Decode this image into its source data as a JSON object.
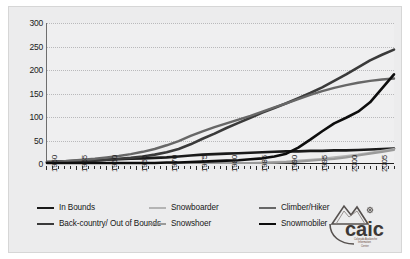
{
  "figure": {
    "background": "#ececed",
    "plot_background": "#efeff0"
  },
  "logo": {
    "name": "caic-logo",
    "wordmark": "caic",
    "line1": "Colorado Avalanche",
    "line2": "Information",
    "line3": "Center"
  },
  "legend": {
    "items": [
      {
        "label": "In Bounds",
        "color": "#1a1a1a",
        "width": 2.6
      },
      {
        "label": "Back-country/ Out of Bounds",
        "color": "#3a3a3a",
        "width": 2.6
      },
      {
        "label": "Snowboarder",
        "color": "#b4b4b4",
        "width": 2.2
      },
      {
        "label": "Snowshoer",
        "color": "#9a9a9a",
        "width": 2.2
      },
      {
        "label": "Climber/Hiker",
        "color": "#676767",
        "width": 2.4
      },
      {
        "label": "Snowmobiler",
        "color": "#0d0d0d",
        "width": 2.6
      }
    ]
  },
  "chart_data": {
    "type": "line",
    "title": "",
    "subtitle": "",
    "xlabel": "",
    "ylabel": "",
    "xlim": [
      1950,
      2008
    ],
    "ylim": [
      0,
      300
    ],
    "yticks": [
      0,
      50,
      100,
      150,
      200,
      250,
      300
    ],
    "xticks": [
      1950,
      1955,
      1960,
      1965,
      1970,
      1975,
      1980,
      1985,
      1990,
      1995,
      2000,
      2005
    ],
    "xtick_labels": [
      "1950",
      "1955",
      "1960",
      "1965",
      "1970",
      "1975",
      "1980",
      "1985",
      "1990",
      "1995",
      "2000",
      "2005"
    ],
    "ytick_labels": [
      "0",
      "50",
      "100",
      "150",
      "200",
      "250",
      "300"
    ],
    "grid": true,
    "legend_position": "bottom",
    "x": [
      1950,
      1952,
      1954,
      1956,
      1958,
      1960,
      1962,
      1964,
      1966,
      1968,
      1970,
      1972,
      1974,
      1976,
      1978,
      1980,
      1982,
      1984,
      1986,
      1988,
      1990,
      1992,
      1994,
      1996,
      1998,
      2000,
      2002,
      2004,
      2006,
      2008
    ],
    "series": [
      {
        "name": "In Bounds",
        "color": "#1a1a1a",
        "width": 2.6,
        "values": [
          2,
          3,
          4,
          5,
          6,
          7,
          8,
          9,
          10,
          11,
          12,
          14,
          16,
          18,
          19,
          20,
          21,
          22,
          23,
          24,
          25,
          25,
          26,
          26,
          27,
          27,
          28,
          29,
          30,
          31
        ]
      },
      {
        "name": "Back-country/ Out of Bounds",
        "color": "#3a3a3a",
        "width": 2.6,
        "values": [
          1,
          2,
          3,
          4,
          5,
          7,
          9,
          11,
          14,
          18,
          23,
          30,
          40,
          52,
          63,
          75,
          86,
          97,
          108,
          118,
          128,
          139,
          150,
          162,
          176,
          190,
          205,
          220,
          232,
          243
        ]
      },
      {
        "name": "Snowboarder",
        "color": "#b4b4b4",
        "width": 2.2,
        "values": [
          0,
          0,
          0,
          0,
          0,
          0,
          0,
          0,
          0,
          0,
          0,
          0,
          0,
          0,
          0,
          0,
          0,
          0,
          1,
          2,
          3,
          5,
          7,
          9,
          12,
          15,
          18,
          22,
          26,
          30
        ]
      },
      {
        "name": "Snowshoer",
        "color": "#9a9a9a",
        "width": 2.2,
        "values": [
          0,
          0,
          0,
          0,
          0,
          0,
          0,
          0,
          0,
          0,
          0,
          0,
          0,
          0,
          0,
          0,
          0,
          0,
          0,
          1,
          2,
          3,
          5,
          7,
          9,
          12,
          16,
          20,
          24,
          28
        ]
      },
      {
        "name": "Climber/Hiker",
        "color": "#676767",
        "width": 2.4,
        "values": [
          2,
          3,
          5,
          7,
          9,
          12,
          15,
          19,
          24,
          30,
          38,
          47,
          58,
          68,
          77,
          85,
          93,
          101,
          110,
          119,
          128,
          137,
          146,
          154,
          161,
          167,
          172,
          176,
          179,
          181
        ]
      },
      {
        "name": "Snowmobiler",
        "color": "#0d0d0d",
        "width": 2.6,
        "values": [
          0,
          0,
          0,
          0,
          0,
          0,
          0,
          0,
          0,
          0,
          1,
          1,
          2,
          3,
          4,
          5,
          6,
          8,
          10,
          14,
          20,
          33,
          50,
          68,
          85,
          97,
          110,
          130,
          160,
          190
        ]
      }
    ]
  }
}
